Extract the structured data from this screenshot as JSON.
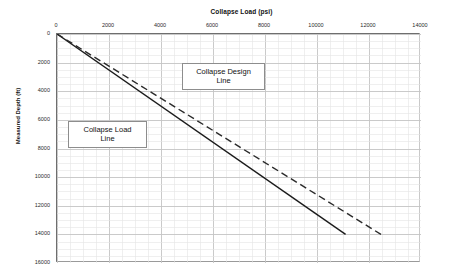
{
  "chart_data": {
    "type": "line",
    "title": "Collapse Load (psi)",
    "xlabel": "Collapse Load (psi)",
    "ylabel": "Measured Depth (ft)",
    "xlim": [
      0,
      14000
    ],
    "ylim": [
      0,
      16000
    ],
    "y_inverted": true,
    "x_axis_position": "top",
    "grid": true,
    "grid_major_x": 2000,
    "grid_minor_x": 500,
    "grid_major_y": 2000,
    "grid_minor_y": 500,
    "legend": "none",
    "xticks": [
      0,
      2000,
      4000,
      6000,
      8000,
      10000,
      12000,
      14000
    ],
    "xtick_labels": [
      "0",
      "2000",
      "4000",
      "6000",
      "8000",
      "10000",
      "12000",
      "14000"
    ],
    "yticks": [
      0,
      2000,
      4000,
      6000,
      8000,
      10000,
      12000,
      14000,
      16000
    ],
    "ytick_labels": [
      "0",
      "2000",
      "4000",
      "6000",
      "8000",
      "10000",
      "12000",
      "14000",
      "16000"
    ],
    "series": [
      {
        "name": "Collapse Load Line",
        "style": "solid",
        "color": "#1b1b1b",
        "width": 1.4,
        "points": [
          [
            0,
            0
          ],
          [
            11100,
            14000
          ]
        ]
      },
      {
        "name": "Collapse Design Line",
        "style": "dashed",
        "color": "#2a2a2a",
        "width": 1.4,
        "dash": "7,4",
        "points": [
          [
            0,
            0
          ],
          [
            12460,
            14000
          ]
        ]
      }
    ],
    "annotations": [
      {
        "id": "design",
        "text": "Collapse Design\nLine",
        "target_series": "Collapse Design Line"
      },
      {
        "id": "load",
        "text": "Collapse Load\nLine",
        "target_series": "Collapse Load Line"
      }
    ],
    "colors": {
      "background": "#ffffff",
      "grid_major": "#c4c4c4",
      "grid_minor": "#e4e4e4",
      "axis": "#6e6e6e",
      "text": "#1a1a1a"
    }
  }
}
